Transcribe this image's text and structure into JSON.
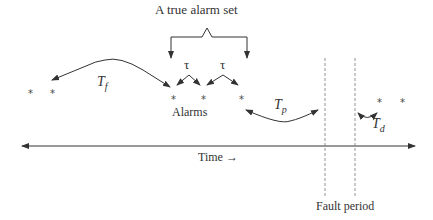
{
  "diagram": {
    "title": "A true alarm set",
    "labels": {
      "alarms": "Alarms",
      "time": "Time",
      "time_arrow": "→",
      "fault_period": "Fault period",
      "tau_1": "τ",
      "tau_2": "τ",
      "Tf_main": "T",
      "Tf_sub": "f",
      "Tp_main": "T",
      "Tp_sub": "p",
      "Td_main": "T",
      "Td_sub": "d"
    },
    "alarm_marker": "*",
    "alarm_markers": [
      {
        "x": 30,
        "y": 92
      },
      {
        "x": 52,
        "y": 92
      },
      {
        "x": 173,
        "y": 98
      },
      {
        "x": 203,
        "y": 98
      },
      {
        "x": 241,
        "y": 98
      },
      {
        "x": 379,
        "y": 101
      },
      {
        "x": 402,
        "y": 101
      }
    ],
    "colors": {
      "line": "#333333",
      "dashed": "#777777",
      "text": "#333333"
    }
  }
}
